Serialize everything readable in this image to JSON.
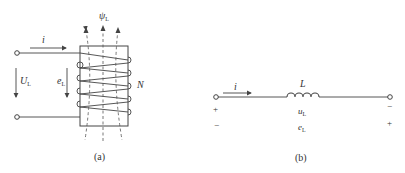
{
  "figure_a": {
    "caption": "(a)",
    "current_label": "i",
    "voltage_label": "U",
    "voltage_sub": "L",
    "emf_label": "e",
    "emf_sub": "L",
    "flux_label": "ψ",
    "flux_sub": "L",
    "turns_label": "N",
    "turns": 5
  },
  "figure_b": {
    "caption": "(b)",
    "current_label": "i",
    "inductor_label": "L",
    "voltage_label": "u",
    "voltage_sub": "L",
    "emf_label": "e",
    "emf_sub": "L",
    "left_top_sign": "+",
    "left_bottom_sign": "−",
    "right_top_sign": "−",
    "right_bottom_sign": "+"
  },
  "colors": {
    "line": "#444444",
    "text": "#333333",
    "background": "#ffffff"
  }
}
